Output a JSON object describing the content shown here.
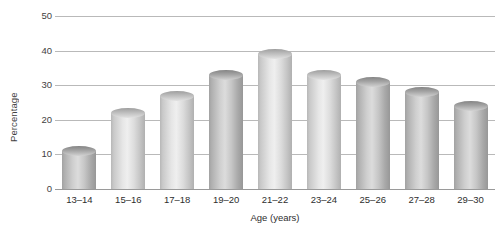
{
  "chart_data": {
    "type": "bar",
    "title": "",
    "xlabel": "Age (years)",
    "ylabel": "Percentage",
    "categories": [
      "13–14",
      "15–16",
      "17–18",
      "19–20",
      "21–22",
      "23–24",
      "25–26",
      "27–28",
      "29–30"
    ],
    "values": [
      11,
      22,
      27,
      33,
      39,
      33,
      31,
      28,
      24
    ],
    "ylim": [
      0,
      50
    ],
    "yticks": [
      0,
      10,
      20,
      30,
      40,
      50
    ],
    "ytick_labels": [
      "0",
      "10",
      "20",
      "30",
      "40",
      "50"
    ],
    "grid": true,
    "legend": "none",
    "bar_style": "cylinder",
    "bar_shades": [
      "dark",
      "light",
      "light",
      "dark",
      "light",
      "light",
      "dark",
      "dark",
      "dark"
    ],
    "colors": {
      "bar_light": "#dcdcdc",
      "bar_dark": "#c4c4c4",
      "gridline": "#b9b9b9",
      "axis": "#9a9a9a",
      "text": "#3a3a3a",
      "background": "#ffffff"
    }
  }
}
